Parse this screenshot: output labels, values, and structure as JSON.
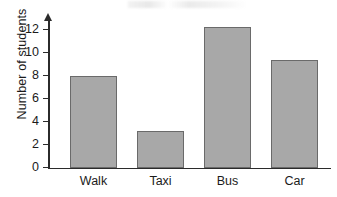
{
  "chart_data": {
    "type": "bar",
    "title": "",
    "xlabel": "",
    "ylabel": "Number of students",
    "categories": [
      "Walk",
      "Taxi",
      "Bus",
      "Car"
    ],
    "values": [
      8,
      3.2,
      12.2,
      9.4
    ],
    "ylim": [
      0,
      13
    ],
    "yticks": [
      0,
      2,
      4,
      6,
      8,
      10,
      12
    ],
    "ytick_labels": [
      "0",
      "2",
      "4",
      "6",
      "8",
      "10",
      "12"
    ],
    "grid": false,
    "legend": null,
    "bar_color": "#a8a8a8",
    "bar_edge_color": "#6a6a6a",
    "axis_color": "#2b2b2b",
    "background_color": "#ffffff"
  }
}
